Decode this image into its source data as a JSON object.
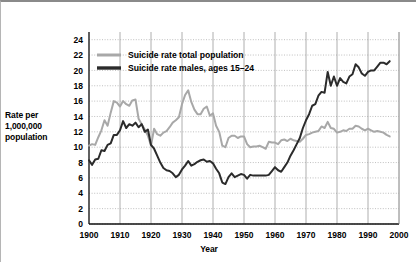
{
  "chart_data": {
    "type": "line",
    "title": "",
    "xlabel": "Year",
    "ylabel": "Rate per 1,000,000 population",
    "ylabel_lines": [
      "Rate per",
      "1,000,000",
      "population"
    ],
    "xlim": [
      1900,
      2000
    ],
    "ylim": [
      0,
      25
    ],
    "xticks": [
      1900,
      1910,
      1920,
      1930,
      1940,
      1950,
      1960,
      1970,
      1980,
      1990,
      2000
    ],
    "yticks": [
      0,
      2,
      4,
      6,
      8,
      10,
      12,
      14,
      16,
      18,
      20,
      22,
      24
    ],
    "grid": "solid vertical gridlines at decades, dotted horizontal gridlines at even values",
    "legend_position": "top-left inside plot",
    "series": [
      {
        "name": "Suicide rate total population",
        "color": "#a8a8a8",
        "x": [
          1900,
          1901,
          1902,
          1903,
          1904,
          1905,
          1906,
          1907,
          1908,
          1909,
          1910,
          1911,
          1912,
          1913,
          1914,
          1915,
          1916,
          1917,
          1918,
          1919,
          1920,
          1921,
          1922,
          1923,
          1924,
          1925,
          1926,
          1927,
          1928,
          1929,
          1930,
          1931,
          1932,
          1933,
          1934,
          1935,
          1936,
          1937,
          1938,
          1939,
          1940,
          1941,
          1942,
          1943,
          1944,
          1945,
          1946,
          1947,
          1948,
          1949,
          1950,
          1951,
          1952,
          1953,
          1954,
          1955,
          1956,
          1957,
          1958,
          1959,
          1960,
          1961,
          1962,
          1963,
          1964,
          1965,
          1966,
          1967,
          1968,
          1969,
          1970,
          1971,
          1972,
          1973,
          1974,
          1975,
          1976,
          1977,
          1978,
          1979,
          1980,
          1981,
          1982,
          1983,
          1984,
          1985,
          1986,
          1987,
          1988,
          1989,
          1990,
          1991,
          1992,
          1993,
          1994,
          1995,
          1996,
          1997
        ],
        "values": [
          10.2,
          10.4,
          10.3,
          11.3,
          12.2,
          13.5,
          12.8,
          14.5,
          16.0,
          15.8,
          15.3,
          16.0,
          15.6,
          15.4,
          16.1,
          16.2,
          13.7,
          13.0,
          12.3,
          11.5,
          10.2,
          12.4,
          11.7,
          11.5,
          11.9,
          12.1,
          12.6,
          13.2,
          13.5,
          13.9,
          15.6,
          16.8,
          17.4,
          15.9,
          14.9,
          14.3,
          14.3,
          15.0,
          15.3,
          14.1,
          14.4,
          12.8,
          12.0,
          10.2,
          10.0,
          11.2,
          11.5,
          11.5,
          11.2,
          11.4,
          11.4,
          10.4,
          10.0,
          10.1,
          10.1,
          10.2,
          10.0,
          9.8,
          10.7,
          10.6,
          10.6,
          10.4,
          10.9,
          11.0,
          10.8,
          11.1,
          10.9,
          10.8,
          10.7,
          11.1,
          11.6,
          11.7,
          11.9,
          12.0,
          12.1,
          12.7,
          12.5,
          13.3,
          12.5,
          12.4,
          11.9,
          12.0,
          12.2,
          12.1,
          12.4,
          12.4,
          12.8,
          12.7,
          12.4,
          12.2,
          12.4,
          12.2,
          12.0,
          12.1,
          12.0,
          11.9,
          11.6,
          11.4
        ]
      },
      {
        "name": "Suicide rate males, ages 15–24",
        "color": "#2b2b2b",
        "x": [
          1900,
          1901,
          1902,
          1903,
          1904,
          1905,
          1906,
          1907,
          1908,
          1909,
          1910,
          1911,
          1912,
          1913,
          1914,
          1915,
          1916,
          1917,
          1918,
          1919,
          1920,
          1921,
          1922,
          1923,
          1924,
          1925,
          1926,
          1927,
          1928,
          1929,
          1930,
          1931,
          1932,
          1933,
          1934,
          1935,
          1936,
          1937,
          1938,
          1939,
          1940,
          1941,
          1942,
          1943,
          1944,
          1945,
          1946,
          1947,
          1948,
          1949,
          1950,
          1951,
          1952,
          1953,
          1954,
          1955,
          1956,
          1957,
          1958,
          1959,
          1960,
          1961,
          1962,
          1963,
          1964,
          1965,
          1966,
          1967,
          1968,
          1969,
          1970,
          1971,
          1972,
          1973,
          1974,
          1975,
          1976,
          1977,
          1978,
          1979,
          1980,
          1981,
          1982,
          1983,
          1984,
          1985,
          1986,
          1987,
          1988,
          1989,
          1990,
          1991,
          1992,
          1993,
          1994,
          1995,
          1996,
          1997
        ],
        "values": [
          8.3,
          7.7,
          8.4,
          8.5,
          9.6,
          9.5,
          10.3,
          10.5,
          11.6,
          11.6,
          12.2,
          13.4,
          12.5,
          13.0,
          12.8,
          13.2,
          12.6,
          13.0,
          12.0,
          12.3,
          10.3,
          9.8,
          8.9,
          8.0,
          7.3,
          7.0,
          6.9,
          6.6,
          6.1,
          6.4,
          7.1,
          7.6,
          8.2,
          7.6,
          7.8,
          8.1,
          8.3,
          8.4,
          8.1,
          8.2,
          7.9,
          7.2,
          6.6,
          5.4,
          5.2,
          6.1,
          6.6,
          6.1,
          6.3,
          6.5,
          6.4,
          5.9,
          6.4,
          6.3,
          6.3,
          6.3,
          6.3,
          6.3,
          6.4,
          6.9,
          7.4,
          7.0,
          6.8,
          7.4,
          8.0,
          8.9,
          9.6,
          10.4,
          11.2,
          12.5,
          13.5,
          14.3,
          15.4,
          15.6,
          16.7,
          17.2,
          17.1,
          19.8,
          18.0,
          19.2,
          18.0,
          19.0,
          18.5,
          18.3,
          19.2,
          19.5,
          20.8,
          20.4,
          19.6,
          19.3,
          19.8,
          20.0,
          20.0,
          20.5,
          21.0,
          21.0,
          20.8,
          21.2
        ]
      }
    ]
  },
  "legend": {
    "items": [
      {
        "label": "Suicide rate total population",
        "color": "#a8a8a8"
      },
      {
        "label": "Suicide rate males, ages 15–24",
        "color": "#2b2b2b"
      }
    ]
  }
}
